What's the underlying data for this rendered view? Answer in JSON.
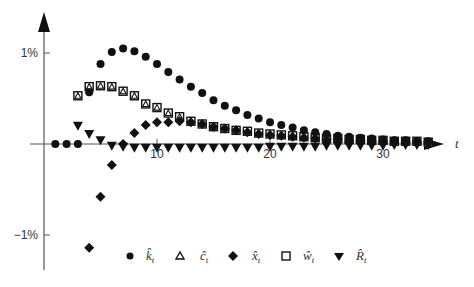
{
  "chart_data": {
    "type": "scatter",
    "title": "",
    "xlabel": "t",
    "ylabel": "",
    "x_ticks": [
      10,
      20,
      30
    ],
    "y_ticks": [
      {
        "value": 1,
        "label": "1%"
      },
      {
        "value": -1,
        "label": "−1%"
      }
    ],
    "xlim": [
      0,
      35
    ],
    "ylim": [
      -1.3,
      1.45
    ],
    "grid": false,
    "legend_position": "bottom",
    "x": [
      1,
      2,
      3,
      4,
      5,
      6,
      7,
      8,
      9,
      10,
      11,
      12,
      13,
      14,
      15,
      16,
      17,
      18,
      19,
      20,
      21,
      22,
      23,
      24,
      25,
      26,
      27,
      28,
      29,
      30,
      31,
      32,
      33,
      34
    ],
    "series": [
      {
        "name": "k_t",
        "label": "k̂",
        "sub": "t",
        "marker": "circle",
        "values": [
          0,
          0,
          0,
          0.57,
          0.88,
          1.01,
          1.05,
          1.02,
          0.96,
          0.88,
          0.79,
          0.71,
          0.63,
          0.56,
          0.48,
          0.42,
          0.37,
          0.32,
          0.28,
          0.24,
          0.21,
          0.18,
          0.15,
          0.13,
          0.11,
          0.09,
          0.08,
          0.07,
          0.06,
          0.05,
          0.04,
          0.04,
          0.03,
          0.03
        ]
      },
      {
        "name": "c_t",
        "label": "ĉ",
        "sub": "t",
        "marker": "triangle-up",
        "values": [
          null,
          null,
          0.53,
          0.63,
          0.64,
          0.63,
          0.58,
          0.53,
          0.44,
          0.4,
          0.34,
          0.3,
          0.25,
          0.22,
          0.19,
          0.17,
          0.15,
          0.14,
          0.12,
          0.11,
          0.1,
          0.09,
          0.08,
          0.07,
          0.06,
          0.06,
          0.05,
          0.05,
          0.04,
          0.04,
          0.03,
          0.03,
          0.03,
          0.02
        ]
      },
      {
        "name": "x_t",
        "label": "x̂",
        "sub": "t",
        "marker": "diamond",
        "values": [
          null,
          null,
          null,
          -1.14,
          -0.58,
          -0.23,
          0.0,
          0.12,
          0.21,
          0.24,
          0.24,
          0.25,
          0.24,
          0.22,
          0.19,
          0.17,
          0.15,
          0.13,
          0.11,
          0.1,
          0.09,
          0.08,
          0.07,
          0.06,
          0.05,
          0.05,
          0.04,
          0.04,
          0.03,
          0.03,
          0.03,
          0.02,
          0.02,
          0.02
        ]
      },
      {
        "name": "w_t",
        "label": "ŵ",
        "sub": "t",
        "marker": "square",
        "values": [
          null,
          null,
          0.53,
          0.63,
          0.64,
          0.63,
          0.58,
          0.53,
          0.44,
          0.4,
          0.34,
          0.3,
          0.25,
          0.22,
          0.19,
          0.17,
          0.15,
          0.14,
          0.12,
          0.11,
          0.1,
          0.09,
          0.08,
          0.07,
          0.06,
          0.06,
          0.05,
          0.05,
          0.04,
          0.04,
          0.03,
          0.03,
          0.03,
          0.02
        ]
      },
      {
        "name": "R_t",
        "label": "R̂",
        "sub": "t",
        "marker": "triangle-down",
        "values": [
          null,
          null,
          0.2,
          0.11,
          0.04,
          -0.02,
          -0.03,
          -0.04,
          -0.04,
          -0.04,
          -0.04,
          -0.04,
          -0.04,
          -0.04,
          -0.04,
          -0.04,
          -0.04,
          -0.04,
          -0.04,
          -0.03,
          -0.03,
          -0.03,
          -0.03,
          -0.03,
          -0.02,
          -0.02,
          -0.02,
          -0.02,
          -0.02,
          -0.02,
          -0.01,
          -0.01,
          -0.01,
          -0.01
        ]
      }
    ]
  },
  "axis": {
    "x_label": "t",
    "tick_10": "10",
    "tick_20": "20",
    "tick_30": "30",
    "y_pos_label": "1%",
    "y_neg_label": "−1%"
  },
  "legend": [
    {
      "label": "k̂",
      "sub": "t"
    },
    {
      "label": "ĉ",
      "sub": "t"
    },
    {
      "label": "x̂",
      "sub": "t"
    },
    {
      "label": "ŵ",
      "sub": "t"
    },
    {
      "label": "R̂",
      "sub": "t"
    }
  ]
}
